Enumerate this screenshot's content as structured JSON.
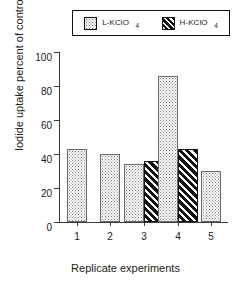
{
  "chart_data": {
    "type": "bar",
    "title": "",
    "xlabel": "Replicate experiments",
    "ylabel": "Iodide uptake percent of control",
    "categories": [
      "1",
      "2",
      "3",
      "4",
      "5"
    ],
    "series": [
      {
        "name": "L-KClO4",
        "legend_text": "L-KClO",
        "legend_subscript": "4",
        "pattern": "dots",
        "values": [
          43,
          40,
          34,
          86,
          30
        ]
      },
      {
        "name": "H-KClO4",
        "legend_text": "H-KClO",
        "legend_subscript": "4",
        "pattern": "diagonal-hatch",
        "values": [
          null,
          null,
          36,
          43,
          null
        ]
      }
    ],
    "ylim": [
      0,
      100
    ],
    "yticks": [
      0,
      20,
      40,
      60,
      80,
      100
    ],
    "ytick_labels": [
      "0",
      "20",
      "40",
      "60",
      "80",
      "100"
    ],
    "grid": false,
    "legend_position": "top"
  },
  "colors": {
    "axis": "#3a3a3a",
    "bar_outline": "#6a6a6a",
    "dot_fill": "#7a7a7a",
    "hatch_fill": "#111111",
    "background": "#ffffff"
  }
}
